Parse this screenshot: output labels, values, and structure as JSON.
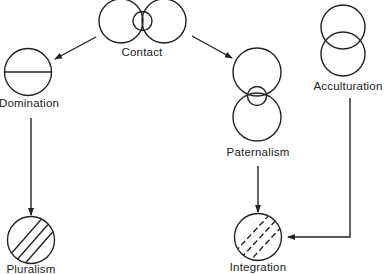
{
  "diagram": {
    "type": "flow",
    "stroke_color": "#222222",
    "background": "#ffffff",
    "nodes": [
      {
        "id": "contact",
        "label": "Contact",
        "shape": "two overlapping circles with small central circle"
      },
      {
        "id": "domination",
        "label": "Domination",
        "shape": "circle bisected by horizontal line"
      },
      {
        "id": "paternalism",
        "label": "Paternalism",
        "shape": "two vertically stacked circles with small central circle"
      },
      {
        "id": "acculturation",
        "label": "Acculturation",
        "shape": "two vertically overlapping circles"
      },
      {
        "id": "pluralism",
        "label": "Pluralism",
        "shape": "circle with three solid diagonal lines"
      },
      {
        "id": "integration",
        "label": "Integration",
        "shape": "circle with three dashed diagonal lines"
      }
    ],
    "edges": [
      {
        "from": "contact",
        "to": "domination"
      },
      {
        "from": "contact",
        "to": "paternalism"
      },
      {
        "from": "domination",
        "to": "pluralism"
      },
      {
        "from": "paternalism",
        "to": "integration"
      },
      {
        "from": "acculturation",
        "to": "integration"
      }
    ]
  },
  "labels": {
    "contact": "Contact",
    "domination": "Domination",
    "paternalism": "Paternalism",
    "acculturation": "Acculturation",
    "pluralism": "Pluralism",
    "integration": "Integration"
  }
}
